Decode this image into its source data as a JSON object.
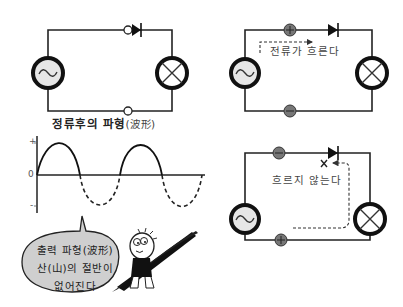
{
  "left_circuit": {
    "source_symbol": "~",
    "load": "lamp",
    "component": "diode",
    "terminals": [
      "open-terminal",
      "open-terminal"
    ]
  },
  "waveform": {
    "title": "정류후의 파형",
    "title_hanja": "(波形)",
    "axis_labels": {
      "plus": "+",
      "zero": "0",
      "minus": "-"
    }
  },
  "speech_bubble": {
    "line1": "출력 파형(波形)",
    "line2": "산(山)의 절반이",
    "line3": "없어진다"
  },
  "forward_circuit": {
    "top_terminal": "+",
    "bottom_terminal": "-",
    "label": "전류가 흐른다"
  },
  "reverse_circuit": {
    "top_terminal": "-",
    "bottom_terminal": "+",
    "blocked_mark": "×",
    "label": "흐르지 않는다"
  },
  "colors": {
    "line": "#222222",
    "terminal_fill": "#777777",
    "source_fill": "#e6e6e6",
    "bubble_fill": "#cfcfcf"
  }
}
